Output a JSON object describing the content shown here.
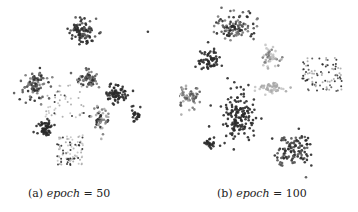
{
  "figure": {
    "subfigures": [
      {
        "label": "(a)",
        "variable": "epoch",
        "equals": " = ",
        "value": "50"
      },
      {
        "label": "(b)",
        "variable": "epoch",
        "equals": " = ",
        "value": "100"
      }
    ]
  },
  "chart_data": [
    {
      "type": "scatter",
      "title": "(a) epoch = 50",
      "xlabel": "",
      "ylabel": "",
      "grid": false,
      "axes": false,
      "legend": false,
      "colors": [
        "#2a2a2a",
        "#555555",
        "#7a7a7a",
        "#a8a8a8",
        "#c4c4c4"
      ],
      "clusters": [
        {
          "cx": 82,
          "cy": 32,
          "rx": 14,
          "ry": 12,
          "n": 90,
          "c": [
            0,
            1
          ]
        },
        {
          "cx": 35,
          "cy": 85,
          "rx": 12,
          "ry": 14,
          "n": 90,
          "c": [
            0,
            1,
            2
          ]
        },
        {
          "cx": 88,
          "cy": 80,
          "rx": 10,
          "ry": 9,
          "n": 60,
          "c": [
            1,
            2,
            0
          ]
        },
        {
          "cx": 115,
          "cy": 93,
          "rx": 11,
          "ry": 11,
          "n": 70,
          "c": [
            0
          ]
        },
        {
          "cx": 135,
          "cy": 115,
          "rx": 6,
          "ry": 6,
          "n": 25,
          "c": [
            0
          ]
        },
        {
          "cx": 45,
          "cy": 128,
          "rx": 8,
          "ry": 8,
          "n": 55,
          "c": [
            0
          ]
        },
        {
          "cx": 100,
          "cy": 120,
          "rx": 10,
          "ry": 12,
          "n": 55,
          "c": [
            0,
            2,
            3
          ]
        },
        {
          "cx": 70,
          "cy": 150,
          "rx": 13,
          "ry": 15,
          "n": 90,
          "c": [
            0,
            3,
            4
          ],
          "sparse": true
        },
        {
          "cx": 65,
          "cy": 100,
          "rx": 20,
          "ry": 18,
          "n": 45,
          "c": [
            0,
            3,
            4
          ],
          "sparse": true
        },
        {
          "cx": 148,
          "cy": 32,
          "rx": 1,
          "ry": 1,
          "n": 1,
          "c": [
            0
          ]
        }
      ]
    },
    {
      "type": "scatter",
      "title": "(b) epoch = 100",
      "xlabel": "",
      "ylabel": "",
      "grid": false,
      "axes": false,
      "legend": false,
      "colors": [
        "#2a2a2a",
        "#555555",
        "#7a7a7a",
        "#a8a8a8",
        "#c4c4c4"
      ],
      "clusters": [
        {
          "cx": 55,
          "cy": 28,
          "rx": 22,
          "ry": 12,
          "n": 110,
          "c": [
            0,
            1,
            2
          ]
        },
        {
          "cx": 30,
          "cy": 60,
          "rx": 12,
          "ry": 11,
          "n": 60,
          "c": [
            0
          ]
        },
        {
          "cx": 92,
          "cy": 57,
          "rx": 10,
          "ry": 10,
          "n": 45,
          "c": [
            3,
            4,
            2
          ]
        },
        {
          "cx": 10,
          "cy": 97,
          "rx": 10,
          "ry": 10,
          "n": 60,
          "c": [
            2,
            3,
            1
          ]
        },
        {
          "cx": 60,
          "cy": 115,
          "rx": 18,
          "ry": 25,
          "n": 150,
          "c": [
            0
          ]
        },
        {
          "cx": 95,
          "cy": 88,
          "rx": 16,
          "ry": 6,
          "n": 50,
          "c": [
            3,
            4
          ]
        },
        {
          "cx": 143,
          "cy": 75,
          "rx": 20,
          "ry": 18,
          "n": 90,
          "c": [
            0,
            1,
            3
          ],
          "sparse": true
        },
        {
          "cx": 115,
          "cy": 150,
          "rx": 18,
          "ry": 16,
          "n": 110,
          "c": [
            0,
            1
          ]
        },
        {
          "cx": 30,
          "cy": 143,
          "rx": 6,
          "ry": 5,
          "n": 22,
          "c": [
            0
          ]
        }
      ]
    }
  ]
}
